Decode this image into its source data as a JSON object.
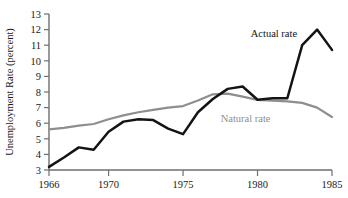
{
  "chart_data": {
    "type": "line",
    "title": "",
    "subtitle": "",
    "xlabel": "",
    "ylabel": "Unemployment Rate (percent)",
    "x": [
      1966,
      1967,
      1968,
      1969,
      1970,
      1971,
      1972,
      1973,
      1974,
      1975,
      1976,
      1977,
      1978,
      1979,
      1980,
      1981,
      1982,
      1983,
      1984,
      1985
    ],
    "xlim": [
      1966,
      1985
    ],
    "ylim": [
      3,
      13
    ],
    "xticks": [
      1966,
      1970,
      1975,
      1980,
      1985
    ],
    "xtick_labels": [
      "1966",
      "1970",
      "1975",
      "1980",
      "1985"
    ],
    "yticks": [
      3,
      4,
      5,
      6,
      7,
      8,
      9,
      10,
      11,
      12,
      13
    ],
    "ytick_labels": [
      "3",
      "4",
      "5",
      "6",
      "7",
      "8",
      "9",
      "10",
      "11",
      "12",
      "13"
    ],
    "grid": false,
    "legend_position": "inline-annotations",
    "series": [
      {
        "name": "Actual rate",
        "color": "#141414",
        "label_x": 1981.1,
        "label_y": 11.55,
        "values": [
          3.2,
          3.8,
          4.45,
          4.3,
          5.45,
          6.1,
          6.25,
          6.2,
          5.65,
          5.3,
          6.7,
          7.55,
          8.2,
          8.35,
          7.5,
          7.6,
          7.6,
          11.0,
          12.0,
          10.7
        ]
      },
      {
        "name": "Natural rate",
        "color": "#8e8e8e",
        "label_x": 1979.2,
        "label_y": 6.05,
        "values": [
          5.6,
          5.7,
          5.85,
          5.95,
          6.25,
          6.5,
          6.7,
          6.85,
          7.0,
          7.1,
          7.45,
          7.85,
          7.9,
          7.7,
          7.5,
          7.45,
          7.4,
          7.3,
          7.0,
          6.4
        ]
      }
    ]
  }
}
